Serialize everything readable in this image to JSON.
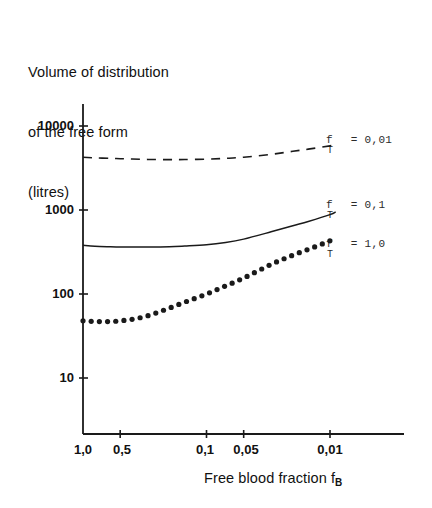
{
  "chart_data": {
    "type": "line",
    "title": "Volume of distribution of the free form (litres)",
    "ylabel_lines": [
      "Volume of distribution",
      "of the free form",
      "(litres)"
    ],
    "xlabel": "Free blood fraction f",
    "xlabel_sub": "B",
    "xscale": "log-reversed",
    "yscale": "log",
    "ylim": [
      7,
      18000
    ],
    "xlim": [
      1.0,
      0.008
    ],
    "grid": false,
    "legend_position": "right-inline-annotations",
    "yticks": [
      10000,
      1000,
      100,
      10
    ],
    "ytick_labels": [
      "10000",
      "1000",
      "100",
      "10"
    ],
    "xticks": [
      1.0,
      0.5,
      0.1,
      0.05,
      0.01
    ],
    "xtick_labels": [
      "1,0",
      "0,5",
      "0,1",
      "0,05",
      "0,01"
    ],
    "series": [
      {
        "name": "f_T = 0,01",
        "label_main": "f",
        "label_sub": "T",
        "label_rest": "= 0,01",
        "style": "dashed",
        "x": [
          1.0,
          0.8,
          0.6,
          0.5,
          0.4,
          0.3,
          0.2,
          0.15,
          0.1,
          0.07,
          0.05,
          0.03,
          0.02,
          0.015,
          0.01,
          0.009
        ],
        "values": [
          4250,
          4180,
          4120,
          4080,
          4040,
          4000,
          3980,
          3990,
          4030,
          4120,
          4250,
          4600,
          5000,
          5300,
          5800,
          6000
        ]
      },
      {
        "name": "f_T = 0,1",
        "label_main": "f",
        "label_sub": "T",
        "label_rest": "= 0,1",
        "style": "solid",
        "x": [
          1.0,
          0.8,
          0.6,
          0.5,
          0.4,
          0.3,
          0.2,
          0.15,
          0.1,
          0.07,
          0.05,
          0.03,
          0.02,
          0.015,
          0.01,
          0.009
        ],
        "values": [
          380,
          370,
          365,
          363,
          362,
          362,
          365,
          372,
          385,
          410,
          450,
          550,
          650,
          730,
          880,
          950
        ]
      },
      {
        "name": "f_T = 1,0",
        "label_main": "f",
        "label_sub": "T",
        "label_rest": "= 1,0",
        "style": "dotted",
        "x": [
          1.0,
          0.8,
          0.6,
          0.5,
          0.4,
          0.3,
          0.2,
          0.15,
          0.1,
          0.07,
          0.05,
          0.03,
          0.02,
          0.015,
          0.01,
          0.009
        ],
        "values": [
          48,
          47,
          47,
          48,
          50,
          55,
          68,
          80,
          100,
          125,
          155,
          225,
          290,
          340,
          430,
          480
        ]
      }
    ]
  },
  "axes": {
    "y_axis_name": "y-axis-log-volume",
    "x_axis_name": "x-axis-log-free-blood-fraction"
  },
  "colors": {
    "ink": "#111111",
    "background": "#ffffff",
    "curve": "#1a1a1a"
  }
}
